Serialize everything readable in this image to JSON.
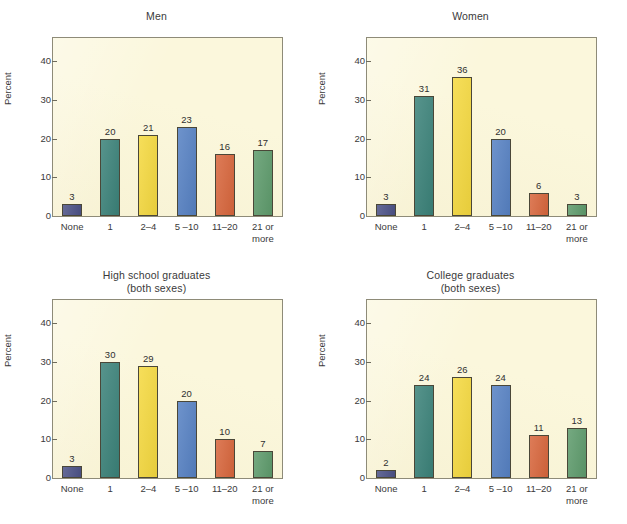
{
  "figure": {
    "background_color": "#ffffff",
    "plot_background_color": "#fbf7dc",
    "frame_color": "#8e8b78"
  },
  "axis": {
    "ylabel": "Percent",
    "yticks": [
      "0",
      "10",
      "20",
      "30",
      "40"
    ],
    "ymax": 46,
    "categories": [
      "None",
      "1",
      "2–4",
      "5 –10",
      "11–20",
      "21 or\nmore"
    ],
    "bar_colors": [
      "#4c5287",
      "#3b8279",
      "#f5d93f",
      "#5681c3",
      "#d8663c",
      "#5e9b6c"
    ]
  },
  "chart_data": {
    "type": "bar",
    "xlabel": "",
    "ylabel": "Percent",
    "ylim": [
      0,
      46
    ],
    "grid": false,
    "legend": "none",
    "categories": [
      "None",
      "1",
      "2–4",
      "5 –10",
      "11–20",
      "21 or more"
    ],
    "panels": [
      {
        "title": "Men",
        "values": [
          3,
          20,
          21,
          23,
          16,
          17
        ],
        "labels": [
          "3",
          "20",
          "21",
          "23",
          "16",
          "17"
        ]
      },
      {
        "title": "Women",
        "values": [
          3,
          31,
          36,
          20,
          6,
          3
        ],
        "labels": [
          "3",
          "31",
          "36",
          "20",
          "6",
          "3"
        ]
      },
      {
        "title": "High school graduates\n(both sexes)",
        "values": [
          3,
          30,
          29,
          20,
          10,
          7
        ],
        "labels": [
          "3",
          "30",
          "29",
          "20",
          "10",
          "7"
        ]
      },
      {
        "title": "College graduates\n(both sexes)",
        "values": [
          2,
          24,
          26,
          24,
          11,
          13
        ],
        "labels": [
          "2",
          "24",
          "26",
          "24",
          "11",
          "13"
        ]
      }
    ]
  }
}
